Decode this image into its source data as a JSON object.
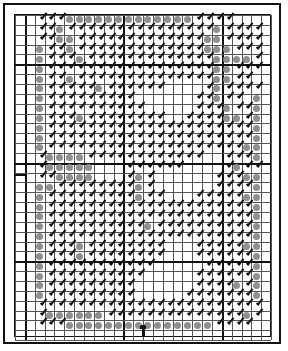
{
  "chart": {
    "title": "",
    "columns": 26,
    "rows": 33,
    "cell_px": 9.85,
    "major_every": 10,
    "major_offset_col": 1,
    "major_offset_row": 5,
    "colors": {
      "grid_minor": "#555555",
      "grid_major": "#111111",
      "dot": "#8f8f8f",
      "stitch": "#111111",
      "frame": "#111111",
      "background": "#ffffff"
    },
    "legend": {
      "D": "gray filled dot (full stitch)",
      "S": "black diagonal mark (half stitch)",
      "B": "dot with half stitch",
      ".": "empty"
    },
    "center_markers": {
      "left_row": 16,
      "bottom_col": 13
    },
    "pattern": [
      "..SSSDDDDDDDDDDDDDSSSS....",
      "..SSDSSSSSSSSSSSSSSSDSSSS.",
      "..SSDDSSSSSSSSSSSSSDDSSSS.",
      "..DSSDSSSSSSSSSSSSSDDDSSS.",
      "..DSSSDSSSSSSSSSSSSSDDDDS.",
      "..DSSSSSSSSSSSSSSSSSDDSSS.",
      "..DSSDSSSSSSSSSSSSSSDDSS..",
      "..DSSSSSDSSSSSS....SDSSSS.",
      "..DSSSSSSSSS......SSDSS.D.",
      "..DSSSSSSSSSS.....SSSDSSD.",
      "..DSSSDSSSSSSSS..SSSSDDSD.",
      "..DSSSSSSSSSSSSSSSSSSSSSD.",
      "..DSSSSSSSSSSSSSSSSSSSSSD.",
      "..DSSSSSSSSSSSSSSSSSSSSDD.",
      "..SDDDDSSSSSSSSSSSS..SSSD.",
      "..SDDDDD...SSSSSS....SDSS.",
      "..SSDDDD...SDS......SSSDD.",
      "..DDSSSSSSSSDS......SSSSD.",
      "..DSSSSSSSSSDSS...SSSSSDD.",
      "..DSSSSSSSSSSSSSSSSSSSSSD.",
      "..DSSSSSSSSSSSSSSSSSSSSSD.",
      "..DSSSSSSSSSSDSSSSSSSSSSD.",
      "..DSSSSSSSSSSSSSSSSSSSSSD.",
      "..DSSSDSSSSSSSS...SSSSSDD.",
      "..DSSSDSSSSSSSS...SSSSSSD.",
      "..DSSSSSSSSSSS.....SSSSSD.",
      "..DSSSSSSSSSS.....SSSSSSD.",
      "..DSSSSSSSSS......SSSSDSD.",
      "..DSSSSSSSSS.....SSSSSSSD.",
      "..SSSSSSSSSSSSSSSSSSSSSSS.",
      "..SDDDDDDSSSSSSSSSSSSSSDS.",
      "..SSSDDDDDDDDDDDDDDDSSSS..",
      ".........................."
    ]
  }
}
